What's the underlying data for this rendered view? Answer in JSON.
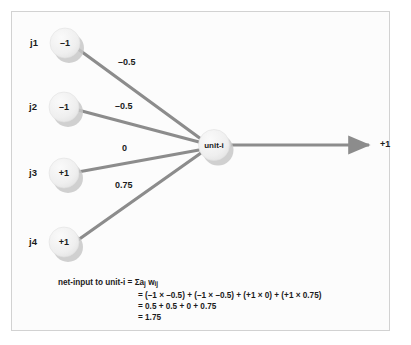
{
  "figure": {
    "background_color": "#fcfcfc",
    "border_color": "#d2d2d2",
    "node_fill": "#f0f0f0",
    "node_shadow": "#c8c8c8",
    "connection_color": "#8c8c8c",
    "text_color": "#1b1b1b"
  },
  "input_nodes": [
    {
      "name": "j1",
      "value": "–1",
      "weight": "–0.5"
    },
    {
      "name": "j2",
      "value": "–1",
      "weight": "–0.5"
    },
    {
      "name": "j3",
      "value": "+1",
      "weight": "0"
    },
    {
      "name": "j4",
      "value": "+1",
      "weight": "0.75"
    }
  ],
  "output_unit": {
    "label": "unit-i",
    "output_value": "+1"
  },
  "formula": {
    "line1_lhs": "net-input to unit-i",
    "line1_rhs": "Σa",
    "line1_sub_a": "j",
    "line1_w": "w",
    "line1_sub_w": "ij",
    "line2": "= (–1 × –0.5) + (–1 × –0.5) + (+1 × 0) + (+1 × 0.75)",
    "line3": "= 0.5 + 0.5 + 0 + 0.75",
    "line4": "= 1.75"
  }
}
